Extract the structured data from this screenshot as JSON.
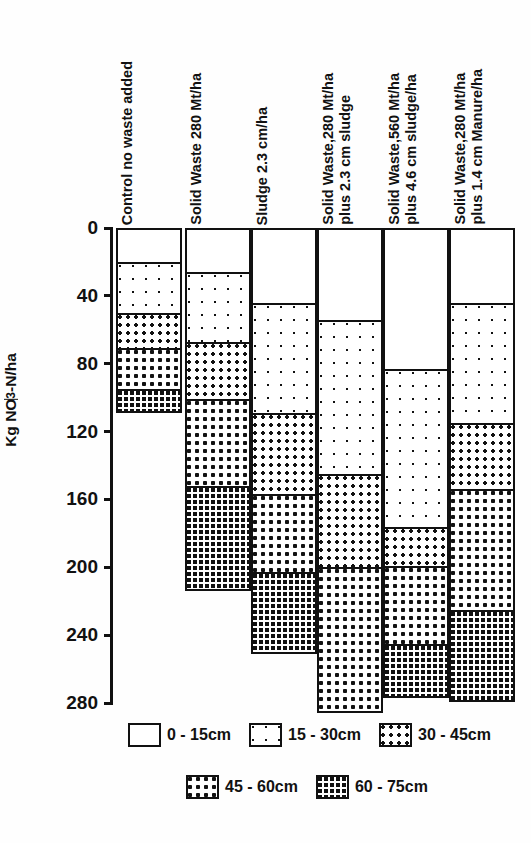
{
  "chart_data": {
    "type": "bar",
    "stacked": true,
    "title": "",
    "xlabel": "",
    "ylabel": "Kg NO3-N/ha",
    "ylabel_parts": {
      "pre": "Kg NO",
      "sub": "3",
      "post": "-N/ha"
    },
    "ylim": [
      0,
      280
    ],
    "y_inverted": true,
    "yticks": [
      0,
      40,
      80,
      120,
      160,
      200,
      240,
      280
    ],
    "ytick_labels": [
      "0",
      "40",
      "80",
      "120",
      "160",
      "200",
      "240",
      "280"
    ],
    "grid": false,
    "legend_position": "bottom",
    "categories": [
      "Control no waste added",
      "Solid Waste 280 Mt/ha",
      "Sludge 2.3 cm/ha",
      "Solid Waste,280 Mt/ha plus 2.3 cm sludge",
      "Solid Waste,560 Mt/ha plus 4.6 cm sludge/ha",
      "Solid Waste,280 Mt/ha plus 1.4 cm Manure/ha"
    ],
    "category_lines": [
      [
        "Control no waste added"
      ],
      [
        "Solid Waste 280 Mt/ha"
      ],
      [
        "Sludge 2.3 cm/ha"
      ],
      [
        "Solid Waste,280 Mt/ha",
        "plus 2.3 cm sludge"
      ],
      [
        "Solid Waste,560 Mt/ha",
        "plus 4.6 cm sludge/ha"
      ],
      [
        "Solid Waste,280 Mt/ha",
        "plus 1.4 cm Manure/ha"
      ]
    ],
    "series": [
      {
        "name": "0 - 15cm",
        "pattern": "p0",
        "values": [
          20,
          26,
          44,
          54,
          83,
          44
        ]
      },
      {
        "name": "15 - 30cm",
        "pattern": "p1",
        "values": [
          30,
          41,
          65,
          91,
          93,
          71
        ]
      },
      {
        "name": "30 - 45cm",
        "pattern": "p2",
        "values": [
          21,
          34,
          48,
          55,
          23,
          39
        ]
      },
      {
        "name": "45 - 60cm",
        "pattern": "p3",
        "values": [
          24,
          51,
          46,
          85,
          46,
          71
        ]
      },
      {
        "name": "60 - 75cm",
        "pattern": "p4",
        "values": [
          13,
          61,
          47,
          0,
          31,
          53
        ]
      }
    ],
    "totals": [
      108,
      213,
      250,
      285,
      276,
      278
    ]
  },
  "legend": {
    "rows": [
      [
        {
          "label": "0 - 15cm",
          "pattern": "p0"
        },
        {
          "label": "15 - 30cm",
          "pattern": "p1"
        },
        {
          "label": "30 - 45cm",
          "pattern": "p2"
        }
      ],
      [
        {
          "label": "45 - 60cm",
          "pattern": "p3"
        },
        {
          "label": "60 - 75cm",
          "pattern": "p4"
        }
      ]
    ]
  }
}
